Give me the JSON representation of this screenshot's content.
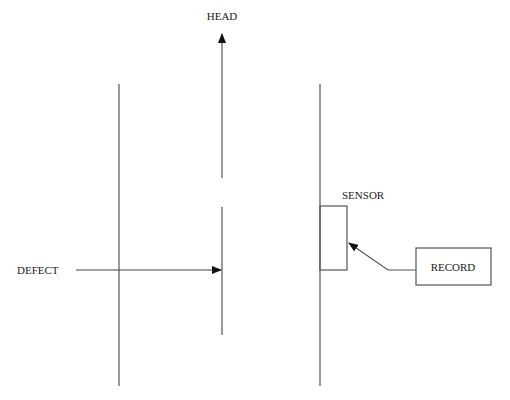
{
  "diagram": {
    "labels": {
      "head": "HEAD",
      "defect": "DEFECT",
      "sensor": "SENSOR",
      "record": "RECORD"
    },
    "colors": {
      "line": "#555555",
      "text": "#222222",
      "background": "#ffffff"
    }
  }
}
